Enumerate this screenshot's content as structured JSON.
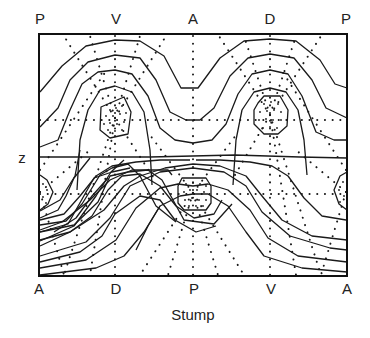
{
  "diagram": {
    "x_axis_title": "Stump",
    "y_axis_title": "z",
    "top_labels": [
      "P",
      "V",
      "A",
      "D",
      "P"
    ],
    "bottom_labels": [
      "A",
      "D",
      "P",
      "V",
      "A"
    ],
    "line_color": "#1a1a1a",
    "background": "#ffffff"
  }
}
